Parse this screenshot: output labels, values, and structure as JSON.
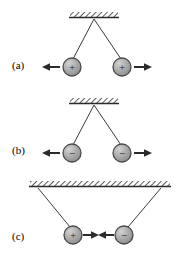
{
  "figure": {
    "background_color": "#ffffff",
    "width": 183,
    "height": 259,
    "ink_color": "#2b2b2b",
    "sphere_fill": "#a8a8a8",
    "sphere_edge": "#4a4a4a",
    "sphere_highlight": "#cfcfcf",
    "ceiling_color": "#333333",
    "arrow_color": "#2b2b2b"
  },
  "panels": [
    {
      "id": "a",
      "label": "(a)",
      "support": {
        "type": "hatched-ceiling",
        "hatch_direction": "forward-slash",
        "x_left": 70,
        "x_right": 118,
        "y": 16,
        "thickness": 5
      },
      "attachment": {
        "type": "single-point",
        "x": 94,
        "y": 21
      },
      "spheres": [
        {
          "name": "left-sphere",
          "sign": "+",
          "charge_label": "positive",
          "cx": 72,
          "cy": 67,
          "r": 9
        },
        {
          "name": "right-sphere",
          "sign": "+",
          "charge_label": "positive",
          "cx": 122,
          "cy": 67,
          "r": 9
        }
      ],
      "force_arrows": [
        {
          "name": "left-force-arrow",
          "direction": "left",
          "from_x": 61,
          "to_x": 43,
          "y": 67
        },
        {
          "name": "right-force-arrow",
          "direction": "right",
          "from_x": 133,
          "to_x": 151,
          "y": 67
        }
      ],
      "interaction": "repulsion"
    },
    {
      "id": "b",
      "label": "(b)",
      "support": {
        "type": "hatched-ceiling",
        "hatch_direction": "forward-slash",
        "x_left": 70,
        "x_right": 118,
        "y": 16,
        "thickness": 5
      },
      "attachment": {
        "type": "single-point",
        "x": 94,
        "y": 21
      },
      "spheres": [
        {
          "name": "left-sphere",
          "sign": "−",
          "charge_label": "negative",
          "cx": 72,
          "cy": 67,
          "r": 9
        },
        {
          "name": "right-sphere",
          "sign": "−",
          "charge_label": "negative",
          "cx": 122,
          "cy": 67,
          "r": 9
        }
      ],
      "force_arrows": [
        {
          "name": "left-force-arrow",
          "direction": "left",
          "from_x": 61,
          "to_x": 43,
          "y": 67
        },
        {
          "name": "right-force-arrow",
          "direction": "right",
          "from_x": 133,
          "to_x": 151,
          "y": 67
        }
      ],
      "interaction": "repulsion"
    },
    {
      "id": "c",
      "label": "(c)",
      "support": {
        "type": "hatched-ceiling",
        "hatch_direction": "forward-slash",
        "x_left": 30,
        "x_right": 170,
        "y": 13,
        "thickness": 5
      },
      "attachment": {
        "type": "two-points",
        "left_x": 38,
        "right_x": 161,
        "y": 18
      },
      "spheres": [
        {
          "name": "left-sphere",
          "sign": "+",
          "charge_label": "positive",
          "cx": 73,
          "cy": 63,
          "r": 9
        },
        {
          "name": "right-sphere",
          "sign": "−",
          "charge_label": "negative",
          "cx": 124,
          "cy": 63,
          "r": 9
        }
      ],
      "force_arrows": [
        {
          "name": "left-force-arrow",
          "direction": "right",
          "from_x": 84,
          "to_x": 99,
          "y": 63
        },
        {
          "name": "right-force-arrow",
          "direction": "left",
          "from_x": 113,
          "to_x": 98,
          "y": 63
        }
      ],
      "interaction": "attraction"
    }
  ]
}
